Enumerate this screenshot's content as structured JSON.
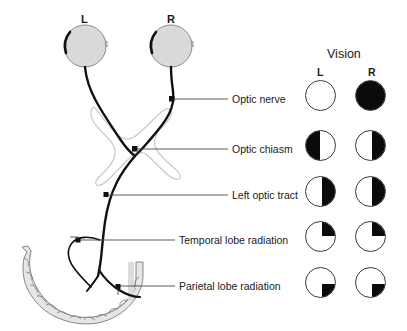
{
  "diagram": {
    "eye_labels": {
      "left": "L",
      "right": "R"
    },
    "anatomy_parts": [
      "left-eye",
      "right-eye",
      "optic-nerve",
      "optic-chiasm",
      "left-optic-tract",
      "temporal-lobe-radiation",
      "parietal-lobe-radiation",
      "occipital-cortex"
    ]
  },
  "callouts": [
    {
      "label": "Optic nerve",
      "y": 99
    },
    {
      "label": "Optic chiasm",
      "y": 149
    },
    {
      "label": "Left optic tract",
      "y": 195
    },
    {
      "label": "Temporal lobe radiation",
      "y": 240
    },
    {
      "label": "Parietal lobe radiation",
      "y": 286
    }
  ],
  "vision": {
    "title": "Vision",
    "columns": [
      {
        "label": "L"
      },
      {
        "label": "R"
      }
    ],
    "rows": [
      {
        "lesion": "Optic nerve",
        "left": {
          "pattern": "none",
          "description": "normal field"
        },
        "right": {
          "pattern": "full",
          "description": "total blindness right eye"
        }
      },
      {
        "lesion": "Optic chiasm",
        "left": {
          "pattern": "left-half",
          "description": "left temporal hemianopia"
        },
        "right": {
          "pattern": "right-half",
          "description": "right temporal hemianopia"
        }
      },
      {
        "lesion": "Left optic tract",
        "left": {
          "pattern": "right-half",
          "description": "right homonymous hemianopia"
        },
        "right": {
          "pattern": "right-half",
          "description": "right homonymous hemianopia"
        }
      },
      {
        "lesion": "Temporal lobe radiation",
        "left": {
          "pattern": "upper-right",
          "description": "right superior quadrantanopia"
        },
        "right": {
          "pattern": "upper-right",
          "description": "right superior quadrantanopia"
        }
      },
      {
        "lesion": "Parietal lobe radiation",
        "left": {
          "pattern": "lower-right",
          "description": "right inferior quadrantanopia"
        },
        "right": {
          "pattern": "lower-right",
          "description": "right inferior quadrantanopia"
        }
      }
    ]
  },
  "colors": {
    "field_fill": "#0b0b0b",
    "field_stroke": "#3a3a3a",
    "eye_fill": "#d9d9d9",
    "eye_stroke": "#6e6e6e",
    "chiasm_stroke": "#c9c9c9",
    "cortex_fill": "#e6e6e6",
    "cortex_stroke": "#7a7a7a",
    "pathway": "#111111",
    "leader_line": "#4a4a4a",
    "background": "#ffffff"
  },
  "geometry": {
    "vision_col_x": {
      "left": 305,
      "right": 355
    },
    "circle_size": 31,
    "row_y": [
      80,
      130,
      176,
      221,
      267
    ]
  }
}
